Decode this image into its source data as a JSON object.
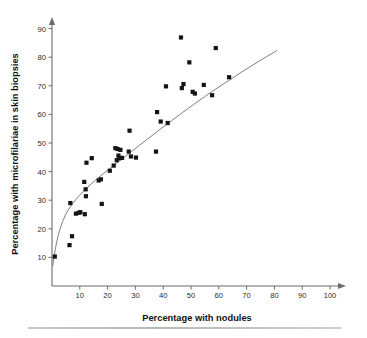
{
  "figure": {
    "background_color": "#ffffff",
    "axis_color": "#6b6b6b",
    "point_color": "#141414",
    "curve_color": "#6f6f6f",
    "footer_rule_color": "#c2c2c2"
  },
  "chart_data": {
    "type": "scatter",
    "title": "",
    "subtitle": "",
    "xlabel": "Percentage with nodules",
    "ylabel": "Percentage with microfilariae in skin biopsies",
    "xlim": [
      0,
      105
    ],
    "ylim": [
      0,
      95
    ],
    "xticks": [
      10,
      20,
      30,
      40,
      50,
      60,
      70,
      80,
      90,
      100
    ],
    "yticks": [
      10,
      20,
      30,
      40,
      50,
      60,
      70,
      80,
      90
    ],
    "xtick_labels": [
      "10",
      "20",
      "30",
      "40",
      "50",
      "60",
      "70",
      "80",
      "90",
      "100"
    ],
    "ytick_labels": [
      "10",
      "20",
      "30",
      "40",
      "50",
      "60",
      "70",
      "80",
      "90"
    ],
    "grid": false,
    "legend": null,
    "legend_position": "none",
    "annotations": [],
    "series": [
      {
        "name": "Communities",
        "marker": "square",
        "marker_size": 2.1,
        "color": "#141414",
        "points": [
          [
            1.0,
            10.3
          ],
          [
            6.3,
            14.3
          ],
          [
            6.6,
            29.0
          ],
          [
            7.2,
            17.4
          ],
          [
            8.6,
            25.3
          ],
          [
            9.6,
            25.6
          ],
          [
            10.2,
            25.8
          ],
          [
            11.8,
            25.1
          ],
          [
            12.2,
            31.4
          ],
          [
            12.4,
            43.1
          ],
          [
            12.1,
            33.8
          ],
          [
            11.6,
            36.4
          ],
          [
            14.3,
            44.7
          ],
          [
            16.8,
            36.9
          ],
          [
            17.6,
            37.3
          ],
          [
            17.9,
            28.7
          ],
          [
            20.8,
            40.3
          ],
          [
            22.2,
            42.1
          ],
          [
            22.8,
            48.2
          ],
          [
            23.3,
            44.0
          ],
          [
            23.6,
            47.9
          ],
          [
            23.9,
            45.6
          ],
          [
            24.2,
            44.7
          ],
          [
            24.6,
            47.6
          ],
          [
            25.2,
            44.8
          ],
          [
            27.6,
            47.0
          ],
          [
            27.9,
            54.3
          ],
          [
            28.4,
            45.3
          ],
          [
            30.2,
            44.9
          ],
          [
            37.4,
            47.0
          ],
          [
            37.8,
            60.8
          ],
          [
            39.1,
            57.5
          ],
          [
            41.0,
            69.8
          ],
          [
            41.6,
            57.0
          ],
          [
            46.4,
            86.9
          ],
          [
            46.7,
            69.2
          ],
          [
            47.3,
            70.6
          ],
          [
            49.4,
            78.2
          ],
          [
            50.6,
            67.9
          ],
          [
            51.4,
            67.3
          ],
          [
            54.6,
            70.3
          ],
          [
            57.6,
            66.7
          ],
          [
            58.9,
            83.2
          ],
          [
            63.7,
            73.0
          ]
        ]
      }
    ],
    "fit_curve": {
      "name": "Fitted curve",
      "color": "#6f6f6f",
      "points": [
        [
          0.3,
          7.0
        ],
        [
          0.8,
          10.5
        ],
        [
          1.6,
          15.0
        ],
        [
          2.6,
          19.0
        ],
        [
          4.0,
          23.0
        ],
        [
          5.6,
          26.2
        ],
        [
          7.4,
          28.8
        ],
        [
          9.4,
          31.2
        ],
        [
          11.6,
          33.4
        ],
        [
          14.0,
          35.6
        ],
        [
          16.6,
          37.8
        ],
        [
          19.4,
          40.0
        ],
        [
          22.4,
          42.3
        ],
        [
          25.4,
          44.6
        ],
        [
          28.6,
          47.0
        ],
        [
          32.0,
          49.6
        ],
        [
          35.6,
          52.3
        ],
        [
          39.2,
          55.0
        ],
        [
          43.0,
          57.8
        ],
        [
          47.0,
          60.7
        ],
        [
          51.0,
          63.5
        ],
        [
          55.2,
          66.4
        ],
        [
          59.4,
          69.2
        ],
        [
          63.8,
          72.0
        ],
        [
          68.2,
          74.8
        ],
        [
          72.8,
          77.6
        ],
        [
          77.4,
          80.3
        ],
        [
          81.0,
          82.4
        ]
      ]
    }
  }
}
